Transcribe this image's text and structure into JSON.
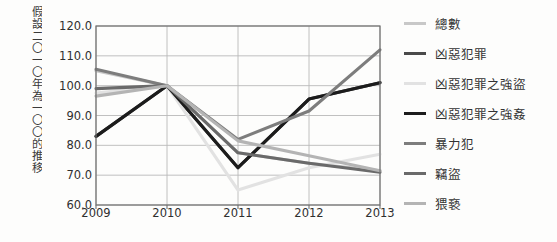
{
  "axis": {
    "y_title": "假設二〇一〇年為一〇〇的推移",
    "y_ticks": [
      "120.0",
      "110.0",
      "100.0",
      "90.0",
      "80.0",
      "70.0",
      "60.0"
    ],
    "x_ticks": [
      "2009",
      "2010",
      "2011",
      "2012",
      "2013"
    ]
  },
  "legend": {
    "items": [
      {
        "label": "總數",
        "color": "#c8c8c8",
        "width": 3.0
      },
      {
        "label": "凶惡犯罪",
        "color": "#4a4a4a",
        "width": 3.4
      },
      {
        "label": "凶惡犯罪之強盜",
        "color": "#e2e2e2",
        "width": 3.0
      },
      {
        "label": "凶惡犯罪之強姦",
        "color": "#1c1c1c",
        "width": 3.4
      },
      {
        "label": "暴力犯",
        "color": "#7d7d7d",
        "width": 3.2
      },
      {
        "label": "竊盜",
        "color": "#6a6a6a",
        "width": 3.2
      },
      {
        "label": "猥褻",
        "color": "#b4b4b4",
        "width": 3.0
      }
    ]
  },
  "chart_data": {
    "type": "line",
    "title": "",
    "xlabel": "",
    "ylabel": "假設二〇一〇年為一〇〇的推移",
    "categories": [
      "2009",
      "2010",
      "2011",
      "2012",
      "2013"
    ],
    "ylim": [
      60.0,
      120.0
    ],
    "ytick_step": 10.0,
    "grid": true,
    "legend_position": "right",
    "series": [
      {
        "name": "總數",
        "color": "#c8c8c8",
        "values": [
          105.0,
          100.0,
          77.5,
          74.0,
          71.5
        ]
      },
      {
        "name": "凶惡犯罪",
        "color": "#4a4a4a",
        "values": [
          83.0,
          100.0,
          72.5,
          95.5,
          101.0
        ]
      },
      {
        "name": "凶惡犯罪之強盜",
        "color": "#e2e2e2",
        "values": [
          97.5,
          100.0,
          65.0,
          72.5,
          77.0
        ]
      },
      {
        "name": "凶惡犯罪之強姦",
        "color": "#1c1c1c",
        "values": [
          83.0,
          100.0,
          72.5,
          95.5,
          101.0
        ]
      },
      {
        "name": "暴力犯",
        "color": "#7d7d7d",
        "values": [
          105.5,
          100.0,
          82.0,
          91.5,
          112.0
        ]
      },
      {
        "name": "竊盜",
        "color": "#6a6a6a",
        "values": [
          99.0,
          100.0,
          77.5,
          74.0,
          71.0
        ]
      },
      {
        "name": "猥褻",
        "color": "#b4b4b4",
        "values": [
          96.5,
          100.0,
          81.5,
          76.5,
          71.5
        ]
      }
    ]
  }
}
